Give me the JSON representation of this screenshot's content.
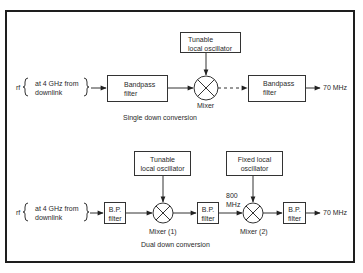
{
  "diagram": {
    "top": {
      "caption": "Single down conversion",
      "input_prefix": "rf",
      "input_text_line1": "at 4 GHz from",
      "input_text_line2": "downlink",
      "lo_line1": "Tunable",
      "lo_line2": "local oscillator",
      "filter1_line1": "Bandpass",
      "filter1_line2": "filter",
      "mixer_label": "Mixer",
      "filter2_line1": "Bandpass",
      "filter2_line2": "filter",
      "output": "70 MHz"
    },
    "bottom": {
      "caption": "Dual down conversion",
      "input_prefix": "rf",
      "input_text_line1": "at 4 GHz from",
      "input_text_line2": "downlink",
      "lo1_line1": "Tunable",
      "lo1_line2": "local oscillator",
      "lo2_line1": "Fixed local",
      "lo2_line2": "oscillator",
      "filter1_line1": "B.P.",
      "filter1_line2": "filter",
      "mixer1_label": "Mixer (1)",
      "filter2_line1": "B.P.",
      "filter2_line2": "filter",
      "intermediate_line1": "800",
      "intermediate_line2": "MHz",
      "mixer2_label": "Mixer (2)",
      "filter3_line1": "B.P.",
      "filter3_line2": "filter",
      "output": "70 MHz"
    }
  }
}
